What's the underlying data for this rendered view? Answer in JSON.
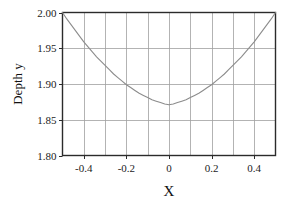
{
  "chart_data": {
    "type": "line",
    "title": "",
    "xlabel": "X",
    "ylabel": "Depth y",
    "xlim": [
      -0.5,
      0.5
    ],
    "ylim": [
      1.8,
      2.0
    ],
    "grid": true,
    "legend": false,
    "x_ticks": [
      -0.4,
      -0.2,
      0,
      0.2,
      0.4
    ],
    "x_tick_labels": [
      "-0.4",
      "-0.2",
      "0",
      "0.2",
      "0.4"
    ],
    "x_minor_gridlines": [
      -0.5,
      -0.4,
      -0.3,
      -0.2,
      -0.1,
      0,
      0.1,
      0.2,
      0.3,
      0.4,
      0.5
    ],
    "y_ticks": [
      1.8,
      1.85,
      1.9,
      1.95,
      2.0
    ],
    "y_tick_labels": [
      "1.80",
      "1.85",
      "1.90",
      "1.95",
      "2.00"
    ],
    "series": [
      {
        "name": "Depth profile",
        "color": "#8c8c8c",
        "x": [
          -0.5,
          -0.48,
          -0.46,
          -0.44,
          -0.42,
          -0.4,
          -0.38,
          -0.36,
          -0.34,
          -0.32,
          -0.3,
          -0.28,
          -0.26,
          -0.24,
          -0.22,
          -0.2,
          -0.18,
          -0.16,
          -0.14,
          -0.12,
          -0.1,
          -0.08,
          -0.06,
          -0.04,
          -0.02,
          0.0,
          0.02,
          0.04,
          0.06,
          0.08,
          0.1,
          0.12,
          0.14,
          0.16,
          0.18,
          0.2,
          0.22,
          0.24,
          0.26,
          0.28,
          0.3,
          0.32,
          0.34,
          0.36,
          0.38,
          0.4,
          0.42,
          0.44,
          0.46,
          0.48,
          0.5
        ],
        "y": [
          2.0,
          1.991,
          1.983,
          1.975,
          1.967,
          1.959,
          1.952,
          1.945,
          1.938,
          1.932,
          1.926,
          1.92,
          1.914,
          1.909,
          1.904,
          1.899,
          1.895,
          1.891,
          1.887,
          1.884,
          1.881,
          1.878,
          1.876,
          1.874,
          1.872,
          1.871,
          1.872,
          1.874,
          1.876,
          1.878,
          1.881,
          1.884,
          1.887,
          1.891,
          1.895,
          1.899,
          1.904,
          1.909,
          1.914,
          1.92,
          1.926,
          1.932,
          1.938,
          1.945,
          1.952,
          1.959,
          1.967,
          1.975,
          1.983,
          1.991,
          2.0
        ]
      }
    ],
    "minimum": {
      "x": 0.0,
      "y": 1.871
    },
    "endpoints": [
      {
        "x": -0.5,
        "y": 2.0
      },
      {
        "x": 0.5,
        "y": 2.0
      }
    ]
  },
  "style": {
    "axis_color": "#2b2b2b",
    "grid_color": "#a0a0a0",
    "curve_color": "#8c8c8c",
    "background": "#ffffff",
    "text_color": "#1c1c1c"
  }
}
